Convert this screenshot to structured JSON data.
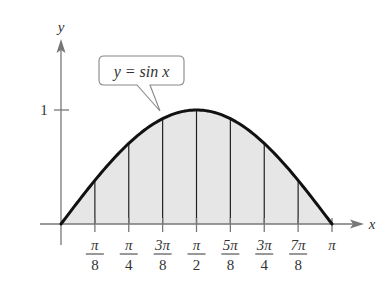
{
  "chart_data": {
    "type": "area",
    "title": "",
    "function": "y = sin x",
    "callout_label": "y = sin x",
    "xlabel": "x",
    "ylabel": "y",
    "xlim": [
      0,
      3.14159
    ],
    "ylim": [
      0,
      1
    ],
    "grid": false,
    "x_ticks": [
      {
        "num": "π",
        "den": "8",
        "value": 0.3927
      },
      {
        "num": "π",
        "den": "4",
        "value": 0.7854
      },
      {
        "num": "3π",
        "den": "8",
        "value": 1.1781
      },
      {
        "num": "π",
        "den": "2",
        "value": 1.5708
      },
      {
        "num": "5π",
        "den": "8",
        "value": 1.9635
      },
      {
        "num": "3π",
        "den": "4",
        "value": 2.3562
      },
      {
        "num": "7π",
        "den": "8",
        "value": 2.7489
      },
      {
        "num": "π",
        "den": "",
        "value": 3.14159
      }
    ],
    "y_ticks": [
      {
        "label": "1",
        "value": 1
      }
    ],
    "x": [
      0,
      0.3927,
      0.7854,
      1.1781,
      1.5708,
      1.9635,
      2.3562,
      2.7489,
      3.14159
    ],
    "values": [
      0,
      0.3827,
      0.7071,
      0.9239,
      1.0,
      0.9239,
      0.7071,
      0.3827,
      0
    ],
    "vertical_lines_at": [
      0.3927,
      0.7854,
      1.1781,
      1.5708,
      1.9635,
      2.3562,
      2.7489
    ],
    "fill_color": "#e6e6e6",
    "curve_color": "#111111",
    "axis_color": "#777777"
  }
}
